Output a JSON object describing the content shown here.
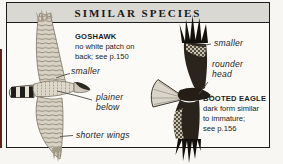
{
  "header": {
    "title": "SIMILAR SPECIES"
  },
  "left_species": {
    "name": "GOSHAWK",
    "caption": [
      "no white patch on",
      "back; see p.150"
    ],
    "labels": {
      "smaller": "smaller",
      "plainer": [
        "plainer",
        "below"
      ],
      "shorter_wings": "shorter wings"
    },
    "illustration": "goshawk-from-above-banking"
  },
  "right_species": {
    "name": "BOOTED EAGLE",
    "caption": [
      "dark form similar",
      "to immature;",
      "see p.156"
    ],
    "labels": {
      "smaller": "smaller",
      "rounder": [
        "rounder",
        "head"
      ]
    },
    "illustration": "booted-eagle-dark-form-banking"
  },
  "colors": {
    "header_bg": "#d9d8d3",
    "panel_border": "#1c1c1c",
    "panel_bg": "#fbfaf6",
    "page_edge_maroon": "#5d241e",
    "goshawk_pale": "#d9d3c5",
    "goshawk_bar": "#857d6e",
    "eagle_dark": "#2b241d",
    "eagle_tail_pale": "#d9d5ca"
  }
}
